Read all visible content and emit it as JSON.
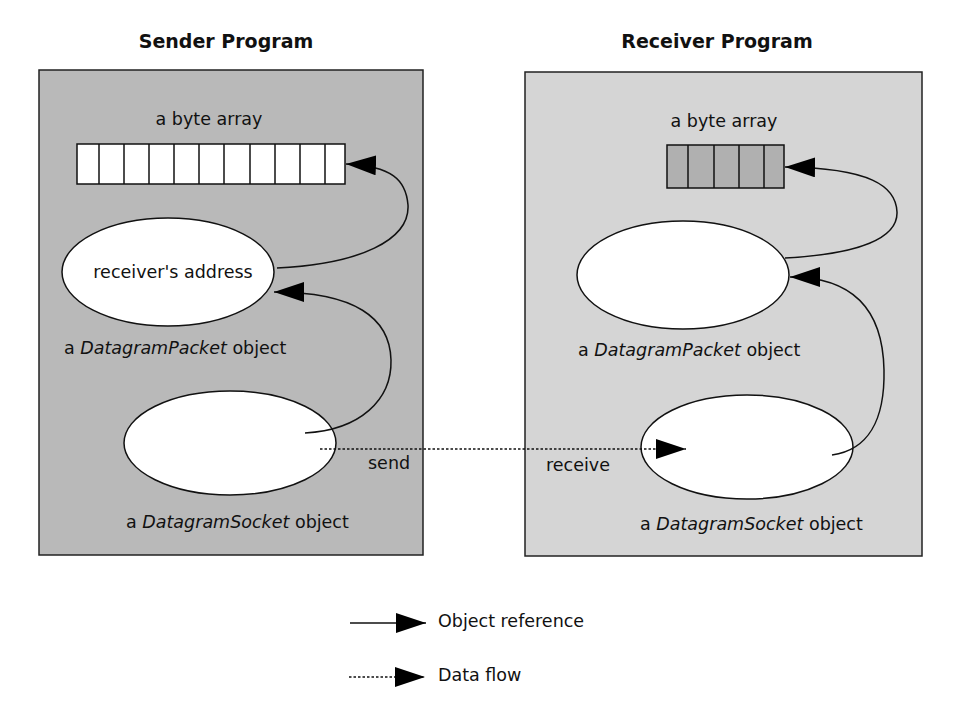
{
  "sender": {
    "title": "Sender Program",
    "byte_array_label": "a byte array",
    "byte_array_cells": 11,
    "packet_ellipse_text": "receiver's address",
    "packet_label_prefix": "a ",
    "packet_label_class": "DatagramPacket",
    "packet_label_suffix": " object",
    "socket_label_prefix": "a ",
    "socket_label_class": "DatagramSocket",
    "socket_label_suffix": " object",
    "action": "send",
    "fill_color": "#b9b9b9"
  },
  "receiver": {
    "title": "Receiver Program",
    "byte_array_label": "a byte array",
    "byte_array_cells": 5,
    "packet_label_prefix": "a ",
    "packet_label_class": "DatagramPacket",
    "packet_label_suffix": " object",
    "socket_label_prefix": "a ",
    "socket_label_class": "DatagramSocket",
    "socket_label_suffix": " object",
    "action": "receive",
    "fill_color": "#d5d5d5"
  },
  "legend": {
    "items": [
      {
        "style": "solid",
        "label": "Object reference"
      },
      {
        "style": "dotted",
        "label": "Data flow"
      }
    ]
  }
}
